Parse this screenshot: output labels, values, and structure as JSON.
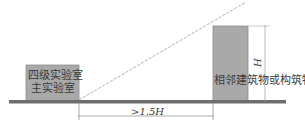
{
  "diagram": {
    "left_building": {
      "label_line1": "四级实验室",
      "label_line2": "主实验室"
    },
    "right_building": {
      "label": "相邻建筑物或构筑物"
    },
    "height_label": "H",
    "distance_label": ">1.5H",
    "colors": {
      "building_fill": "#a8a8a8",
      "building_stroke": "#8a8a8a",
      "ground": "#707070",
      "lines": "#888888"
    }
  }
}
